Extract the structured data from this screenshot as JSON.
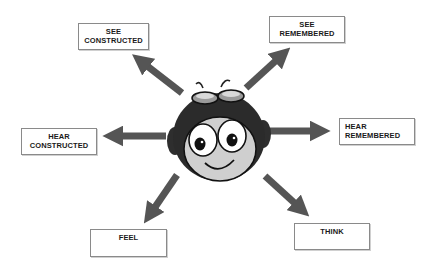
{
  "diagram": {
    "title": "",
    "center": {
      "figure": "cartoon-aviator-face",
      "description": "Cartoon character with goggles and earflap helmet"
    },
    "arrow_color": "#555555",
    "labels": [
      {
        "id": "see-constructed",
        "line1": "SEE",
        "line2": "CONSTRUCTED",
        "direction": "up-left"
      },
      {
        "id": "see-remembered",
        "line1": "SEE",
        "line2": "REMEMBERED",
        "direction": "up-right"
      },
      {
        "id": "hear-constructed",
        "line1": "HEAR",
        "line2": "CONSTRUCTED",
        "direction": "left"
      },
      {
        "id": "hear-remembered",
        "line1": "HEAR",
        "line2": "REMEMBERED",
        "direction": "right"
      },
      {
        "id": "feel",
        "line1": "FEEL",
        "line2": "",
        "direction": "down-left"
      },
      {
        "id": "think",
        "line1": "THINK",
        "line2": "",
        "direction": "down-right"
      }
    ]
  }
}
